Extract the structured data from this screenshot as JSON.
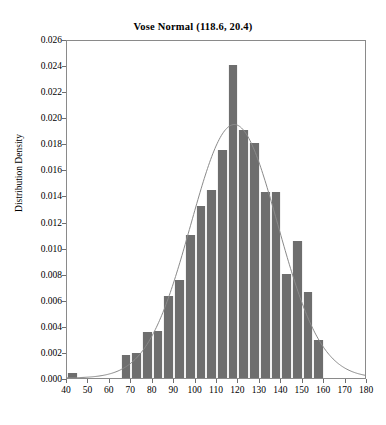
{
  "chart_data": {
    "type": "bar",
    "title": "Vose Normal (118.6, 20.4)",
    "xlabel": "",
    "ylabel": "Distribution Density",
    "xlim": [
      40,
      180
    ],
    "ylim": [
      0.0,
      0.026
    ],
    "xticks": [
      40,
      50,
      60,
      70,
      80,
      90,
      100,
      110,
      120,
      130,
      140,
      150,
      160,
      170,
      180
    ],
    "yticks": [
      "0.000",
      "0.002",
      "0.004",
      "0.006",
      "0.008",
      "0.010",
      "0.012",
      "0.014",
      "0.016",
      "0.018",
      "0.020",
      "0.022",
      "0.024",
      "0.026"
    ],
    "grid": false,
    "legend": null,
    "bin_width": 5,
    "bar_color": "#6e6e6e",
    "curve_color": "#8a8a8a",
    "bin_starts": [
      40,
      45,
      65,
      70,
      75,
      80,
      85,
      90,
      95,
      100,
      105,
      110,
      115,
      120,
      125,
      130,
      135,
      140,
      145,
      150,
      155
    ],
    "values": [
      0.0004,
      0.0,
      0.0018,
      0.0019,
      0.0035,
      0.0036,
      0.0063,
      0.0075,
      0.011,
      0.0132,
      0.0144,
      0.0175,
      0.024,
      0.019,
      0.018,
      0.0143,
      0.0143,
      0.008,
      0.0105,
      0.0066,
      0.0029
    ],
    "bars": [
      {
        "x0": 40,
        "x1": 45,
        "y": 0.0004
      },
      {
        "x0": 65,
        "x1": 70,
        "y": 0.0018
      },
      {
        "x0": 70,
        "x1": 75,
        "y": 0.0019
      },
      {
        "x0": 75,
        "x1": 80,
        "y": 0.0035
      },
      {
        "x0": 80,
        "x1": 85,
        "y": 0.0036
      },
      {
        "x0": 85,
        "x1": 90,
        "y": 0.0063
      },
      {
        "x0": 90,
        "x1": 95,
        "y": 0.0075
      },
      {
        "x0": 95,
        "x1": 100,
        "y": 0.011
      },
      {
        "x0": 100,
        "x1": 105,
        "y": 0.0132
      },
      {
        "x0": 105,
        "x1": 110,
        "y": 0.0144
      },
      {
        "x0": 110,
        "x1": 115,
        "y": 0.0175
      },
      {
        "x0": 115,
        "x1": 120,
        "y": 0.024
      },
      {
        "x0": 120,
        "x1": 125,
        "y": 0.019
      },
      {
        "x0": 125,
        "x1": 130,
        "y": 0.018
      },
      {
        "x0": 130,
        "x1": 135,
        "y": 0.0143
      },
      {
        "x0": 135,
        "x1": 140,
        "y": 0.0143
      },
      {
        "x0": 140,
        "x1": 145,
        "y": 0.008
      },
      {
        "x0": 145,
        "x1": 150,
        "y": 0.0105
      },
      {
        "x0": 150,
        "x1": 155,
        "y": 0.0066
      },
      {
        "x0": 155,
        "x1": 160,
        "y": 0.0029
      }
    ],
    "overlay_curve": {
      "name": "normal-pdf",
      "distribution": "Normal",
      "mean": 118.6,
      "sd": 20.4,
      "peak": 0.01955
    }
  }
}
